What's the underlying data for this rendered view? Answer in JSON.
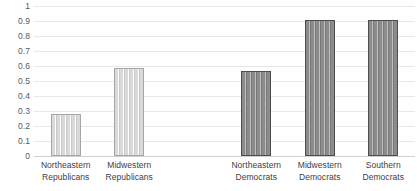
{
  "chart_data": {
    "type": "bar",
    "title": "",
    "subtitle": "",
    "xlabel": "",
    "ylabel": "",
    "ylim": [
      0,
      1
    ],
    "ytick_labels": [
      "1",
      "0.9",
      "0.8",
      "0.7",
      "0.6",
      "0.5",
      "0.4",
      "0.3",
      "0.2",
      "0.1",
      "0"
    ],
    "ytick_values": [
      1,
      0.9,
      0.8,
      0.7,
      0.6,
      0.5,
      0.4,
      0.3,
      0.2,
      0.1,
      0
    ],
    "grid": true,
    "legend": false,
    "legend_position": "none",
    "categories": [
      "Northeastern Republicans",
      "Midwestern Republicans",
      "",
      "Northeastern Democrats",
      "Midwestern Democrats",
      "Southern Democrats"
    ],
    "values": [
      0.28,
      0.59,
      null,
      0.57,
      0.905,
      0.91
    ],
    "bars": [
      {
        "label_line1": "Northeastern",
        "label_line2": "Republicans",
        "value": 0.28,
        "group": "rep",
        "color": "#d9d9d9",
        "border_color": "#a6a6a6"
      },
      {
        "label_line1": "Midwestern",
        "label_line2": "Republicans",
        "value": 0.59,
        "group": "rep",
        "color": "#d9d9d9",
        "border_color": "#a6a6a6"
      },
      {
        "label_line1": "",
        "label_line2": "",
        "value": null,
        "group": "empty",
        "color": "",
        "border_color": ""
      },
      {
        "label_line1": "Northeastern",
        "label_line2": "Democrats",
        "value": 0.57,
        "group": "dem",
        "color": "#8c8c8c",
        "border_color": "#4d4d4d"
      },
      {
        "label_line1": "Midwestern",
        "label_line2": "Democrats",
        "value": 0.905,
        "group": "dem",
        "color": "#8c8c8c",
        "border_color": "#4d4d4d"
      },
      {
        "label_line1": "Southern",
        "label_line2": "Democrats",
        "value": 0.91,
        "group": "dem",
        "color": "#8c8c8c",
        "border_color": "#4d4d4d"
      }
    ]
  },
  "style": {
    "background": "#ffffff",
    "gridline_color": "#e8e8e8",
    "axis_text_color": "#595959",
    "label_text_color": "#404040"
  }
}
